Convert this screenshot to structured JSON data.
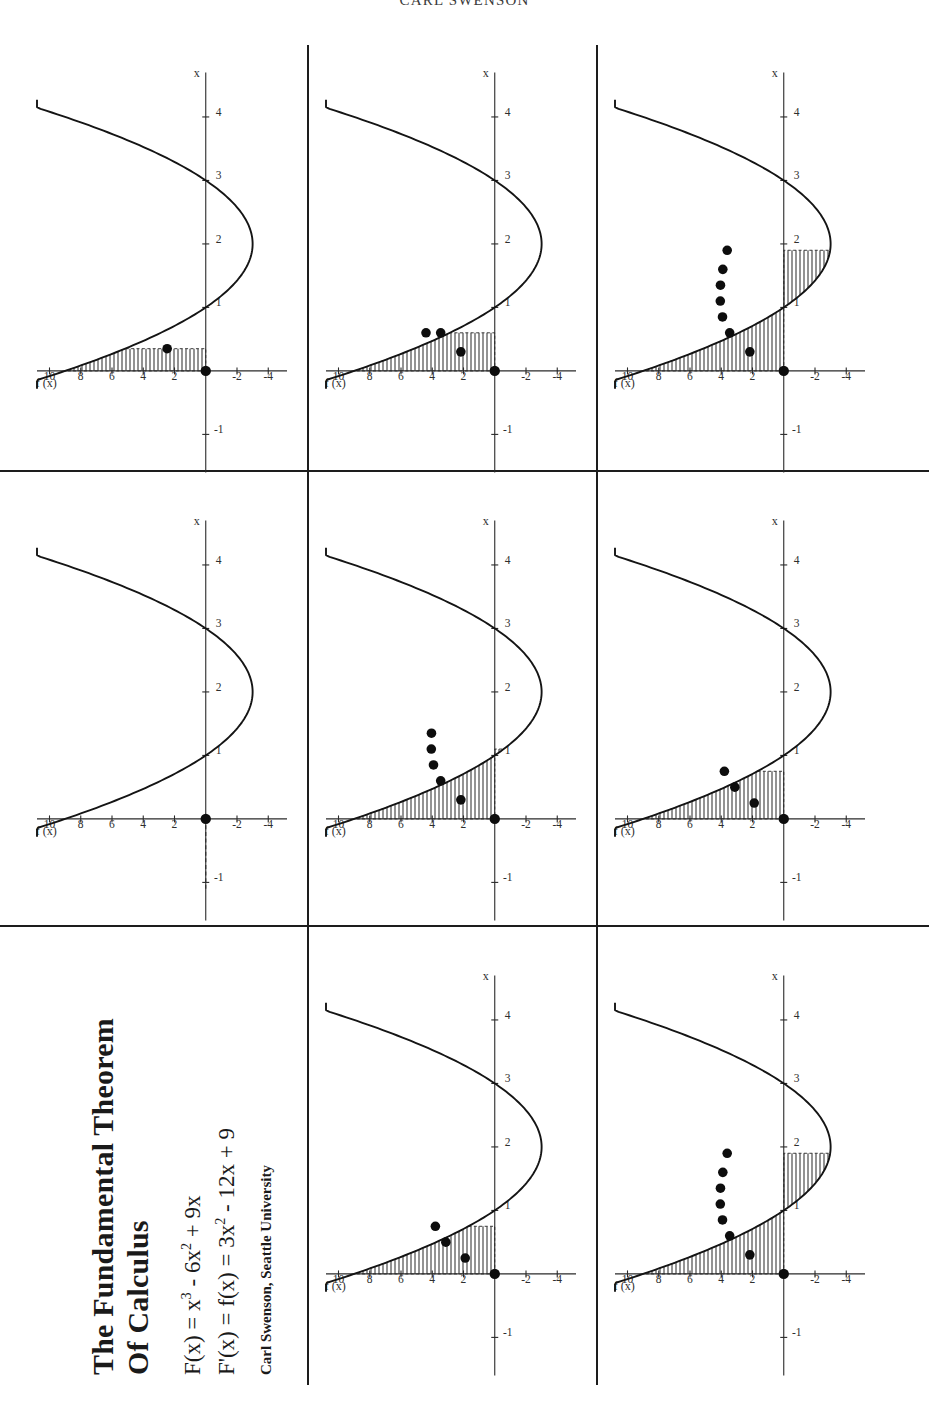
{
  "running_head": "CARL SWENSON",
  "title": {
    "line1": "The Fundamental Theorem",
    "line2": "Of Calculus",
    "eq1_pre": "F(x) = x",
    "eq1_sup": "3",
    "eq1_mid": " - 6x",
    "eq1_sup2": "2",
    "eq1_post": " + 9x",
    "eq2_pre": "F'(x) = f(x) = 3x",
    "eq2_sup": "2",
    "eq2_post": " - 12x + 9",
    "byline": "Carl Swenson, Seattle University"
  },
  "axes": {
    "ylabel": "f (x)",
    "xlabel": "x",
    "yticks": [
      "10",
      "8",
      "6",
      "4",
      "2",
      "-2",
      "-4"
    ],
    "xticks": [
      "-1",
      "1",
      "2",
      "3",
      "4"
    ],
    "ytick_values": [
      10,
      8,
      6,
      4,
      2,
      -2,
      -4
    ],
    "xtick_values": [
      -1,
      1,
      2,
      3,
      4
    ],
    "xlim": [
      -1.6,
      4.7
    ],
    "ylim": [
      -5.2,
      10.8
    ]
  },
  "chart_data": {
    "type": "line",
    "title": "The Fundamental Theorem Of Calculus",
    "xlabel": "x",
    "ylabel": "f (x)",
    "xlim": [
      -1.6,
      4.7
    ],
    "ylim": [
      -5.2,
      10.8
    ],
    "grid": false,
    "legend": "none",
    "curve_expression": "f(x) = 3x^2 - 12x + 9",
    "antiderivative_expression": "F(x) = x^3 - 6x^2 + 9x",
    "curve_x": [
      -1.6,
      -1.2,
      -0.8,
      -0.4,
      0,
      0.4,
      0.8,
      1.2,
      1.6,
      2.0,
      2.4,
      2.8,
      3.2,
      3.6,
      4.0,
      4.4,
      4.7
    ],
    "curve_y": [
      35.9,
      27.7,
      20.5,
      14.3,
      9,
      4.7,
      1.3,
      -1.1,
      -2.5,
      -3.0,
      -2.5,
      -1.1,
      1.3,
      4.7,
      9,
      14.3,
      18.9
    ],
    "panels": [
      {
        "id": "panel-1",
        "row": 1,
        "col": 1,
        "caption": "a = 0, b = 0.35 (first sliver)",
        "area_from": 0,
        "area_to": 0.35,
        "dots": [
          {
            "x": 0.0,
            "y": 0.0,
            "role": "origin-point"
          },
          {
            "x": 0.35,
            "y": 2.47,
            "role": "accumulation-point"
          }
        ]
      },
      {
        "id": "panel-2",
        "row": 1,
        "col": 2,
        "caption": "a = 0, b = 0 (no area yet)",
        "area_from": 0,
        "area_to": 0,
        "dots": [
          {
            "x": 0.0,
            "y": 0.0,
            "role": "origin-point"
          }
        ]
      },
      {
        "id": "panel-3",
        "row": 1,
        "col": 3,
        "caption": "a = 0, b = 0.75",
        "area_from": 0,
        "area_to": 0.75,
        "dots": [
          {
            "x": 0.0,
            "y": 0.0,
            "role": "origin-point"
          },
          {
            "x": 0.25,
            "y": 1.89,
            "role": "accumulation-point"
          },
          {
            "x": 0.5,
            "y": 3.13,
            "role": "accumulation-point"
          },
          {
            "x": 0.75,
            "y": 3.8,
            "role": "accumulation-point"
          }
        ]
      },
      {
        "id": "panel-4",
        "row": 2,
        "col": 1,
        "caption": "a = 0, b = 0.6",
        "area_from": 0,
        "area_to": 0.6,
        "dots": [
          {
            "x": 0.0,
            "y": 0.0,
            "role": "origin-point"
          },
          {
            "x": 0.3,
            "y": 2.17,
            "role": "accumulation-point"
          },
          {
            "x": 0.6,
            "y": 3.46,
            "role": "accumulation-point"
          },
          {
            "x": 0.6,
            "y": 4.4,
            "role": "accumulation-point"
          }
        ]
      },
      {
        "id": "panel-5",
        "row": 2,
        "col": 2,
        "caption": "a = 0, b = 1.1",
        "area_from": 0,
        "area_to": 1.1,
        "dots": [
          {
            "x": 0.0,
            "y": 0.0,
            "role": "origin-point"
          },
          {
            "x": 0.3,
            "y": 2.17,
            "role": "accumulation-point"
          },
          {
            "x": 0.6,
            "y": 3.46,
            "role": "accumulation-point"
          },
          {
            "x": 0.85,
            "y": 3.92,
            "role": "accumulation-point"
          },
          {
            "x": 1.1,
            "y": 4.06,
            "role": "accumulation-point"
          },
          {
            "x": 1.35,
            "y": 4.05,
            "role": "accumulation-point"
          }
        ]
      },
      {
        "id": "panel-6",
        "row": 2,
        "col": 3,
        "caption": "a = 0, b = 1.9 (area through the zero of f)",
        "area_from": 0,
        "area_to": 1.9,
        "dots": [
          {
            "x": 0.0,
            "y": 0.0,
            "role": "origin-point"
          },
          {
            "x": 0.3,
            "y": 2.17,
            "role": "accumulation-point"
          },
          {
            "x": 0.6,
            "y": 3.46,
            "role": "accumulation-point"
          },
          {
            "x": 0.85,
            "y": 3.92,
            "role": "accumulation-point"
          },
          {
            "x": 1.1,
            "y": 4.06,
            "role": "accumulation-point"
          },
          {
            "x": 1.35,
            "y": 4.05,
            "role": "accumulation-point"
          },
          {
            "x": 1.6,
            "y": 3.9,
            "role": "accumulation-point"
          },
          {
            "x": 1.9,
            "y": 3.62,
            "role": "accumulation-point"
          }
        ]
      }
    ]
  }
}
